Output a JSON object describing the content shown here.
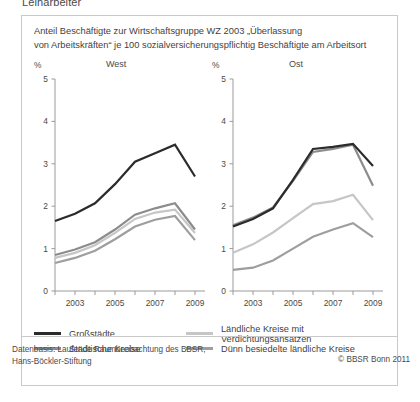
{
  "cutoff_heading": "Leiharbeiter",
  "caption": "Anteil Beschäftigte zur Wirtschaftsgruppe WZ 2003 „Überlassung von Arbeitskräften“ je 100 sozialversicherungspflichtig Beschäftigte am Arbeitsort",
  "caption_line1": "Anteil Beschäftigte zur Wirtschaftsgruppe WZ 2003 „Überlassung",
  "caption_line2": "von Arbeitskräften“ je 100 sozialversicherungspflichtig Beschäftigte am Arbeitsort",
  "axis_unit": "%",
  "panels": {
    "west_title": "West",
    "ost_title": "Ost"
  },
  "legend": {
    "items": [
      {
        "label": "Großstädte",
        "color": "#2b2b2b"
      },
      {
        "label": "Ländliche Kreise mit Verdichtungsansätzen",
        "color": "#c6c6c6"
      },
      {
        "label": "Städtische Kreise",
        "color": "#8c8c8c"
      },
      {
        "label": "Dünn besiedelte ländliche Kreise",
        "color": "#9e9e9e"
      }
    ]
  },
  "footnote_line1": "Datenbasis: Laufende Raumbeobachtung des BBSR,",
  "footnote_line2": "Hans-Böckler-Stiftung",
  "copyright": "© BBSR Bonn 2011",
  "chart_data": [
    {
      "type": "line",
      "title": "West",
      "xlabel": "",
      "ylabel": "%",
      "ylim": [
        0,
        5
      ],
      "yticks": [
        0,
        1,
        2,
        3,
        4,
        5
      ],
      "ytick_labels": [
        "0",
        "1",
        "2",
        "3",
        "4",
        "5"
      ],
      "grid": false,
      "legend_position": "below",
      "x": [
        2002,
        2003,
        2004,
        2005,
        2006,
        2007,
        2008,
        2009
      ],
      "xtick_labels": [
        "",
        "2003",
        "",
        "2005",
        "",
        "2007",
        "",
        "2009"
      ],
      "series": [
        {
          "name": "Großstädte",
          "color": "#2b2b2b",
          "values": [
            1.65,
            1.82,
            2.07,
            2.52,
            3.05,
            3.25,
            3.45,
            2.7
          ]
        },
        {
          "name": "Städtische Kreise",
          "color": "#8c8c8c",
          "values": [
            0.85,
            0.98,
            1.15,
            1.45,
            1.8,
            1.95,
            2.07,
            1.45
          ]
        },
        {
          "name": "Ländliche Kreise mit Verdichtungsansätzen",
          "color": "#c6c6c6",
          "values": [
            0.78,
            0.9,
            1.08,
            1.37,
            1.7,
            1.85,
            1.92,
            1.37
          ]
        },
        {
          "name": "Dünn besiedelte ländliche Kreise",
          "color": "#9e9e9e",
          "values": [
            0.66,
            0.78,
            0.95,
            1.22,
            1.52,
            1.68,
            1.77,
            1.2
          ]
        }
      ]
    },
    {
      "type": "line",
      "title": "Ost",
      "xlabel": "",
      "ylabel": "%",
      "ylim": [
        0,
        5
      ],
      "yticks": [
        0,
        1,
        2,
        3,
        4,
        5
      ],
      "ytick_labels": [
        "0",
        "1",
        "2",
        "3",
        "4",
        "5"
      ],
      "grid": false,
      "legend_position": "below",
      "x": [
        2002,
        2003,
        2004,
        2005,
        2006,
        2007,
        2008,
        2009
      ],
      "xtick_labels": [
        "",
        "2003",
        "",
        "2005",
        "",
        "2007",
        "",
        "2009"
      ],
      "series": [
        {
          "name": "Großstädte",
          "color": "#2b2b2b",
          "values": [
            1.52,
            1.7,
            1.95,
            2.62,
            3.35,
            3.4,
            3.47,
            2.95
          ]
        },
        {
          "name": "Städtische Kreise",
          "color": "#8c8c8c",
          "values": [
            1.55,
            1.73,
            1.97,
            2.6,
            3.28,
            3.35,
            3.45,
            2.48
          ]
        },
        {
          "name": "Ländliche Kreise mit Verdichtungsansätzen",
          "color": "#c6c6c6",
          "values": [
            0.9,
            1.1,
            1.38,
            1.72,
            2.05,
            2.12,
            2.27,
            1.67
          ]
        },
        {
          "name": "Dünn besiedelte ländliche Kreise",
          "color": "#9e9e9e",
          "values": [
            0.5,
            0.55,
            0.72,
            1.0,
            1.28,
            1.45,
            1.6,
            1.27
          ]
        }
      ]
    }
  ]
}
